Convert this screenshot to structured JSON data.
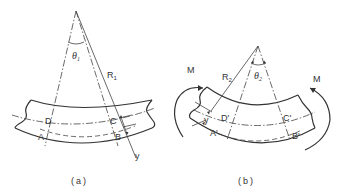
{
  "figure_a": {
    "caption": "(a)",
    "angle_label": "θ",
    "angle_sub": "1",
    "radius_label": "R",
    "radius_sub": "1",
    "points": {
      "D": "D",
      "C": "C",
      "A": "A",
      "B": "B"
    },
    "dimension_label": "y"
  },
  "figure_b": {
    "caption": "(b)",
    "angle_label": "θ",
    "angle_sub": "2",
    "radius_label": "R",
    "radius_sub": "2",
    "points": {
      "D": "D'",
      "C": "C'",
      "A": "A'",
      "B": "B'"
    },
    "dimension_label": "y",
    "moment_left": "M",
    "moment_right": "M"
  },
  "colors": {
    "line": "#333333",
    "background": "#ffffff"
  }
}
